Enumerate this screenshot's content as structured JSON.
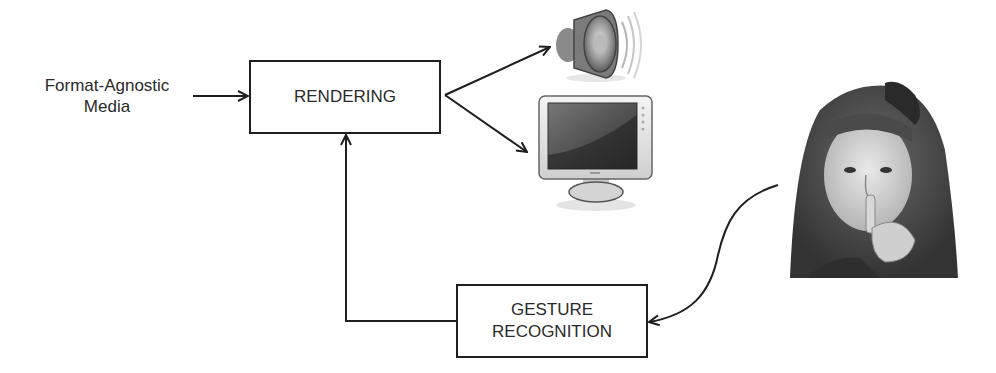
{
  "diagram": {
    "input_label_line1": "Format-Agnostic",
    "input_label_line2": "Media",
    "nodes": {
      "rendering": {
        "label": "RENDERING"
      },
      "gesture": {
        "label_line1": "GESTURE",
        "label_line2": "RECOGNITION"
      }
    },
    "outputs": [
      {
        "name": "speaker",
        "icon": "speaker-icon"
      },
      {
        "name": "monitor",
        "icon": "monitor-icon"
      }
    ],
    "user_image": {
      "subject": "girl making shush gesture",
      "icon": "person-photo"
    },
    "edges": [
      {
        "from": "Format-Agnostic Media",
        "to": "RENDERING"
      },
      {
        "from": "RENDERING",
        "to": "speaker"
      },
      {
        "from": "RENDERING",
        "to": "monitor"
      },
      {
        "from": "user",
        "to": "GESTURE RECOGNITION"
      },
      {
        "from": "GESTURE RECOGNITION",
        "to": "RENDERING"
      }
    ]
  }
}
